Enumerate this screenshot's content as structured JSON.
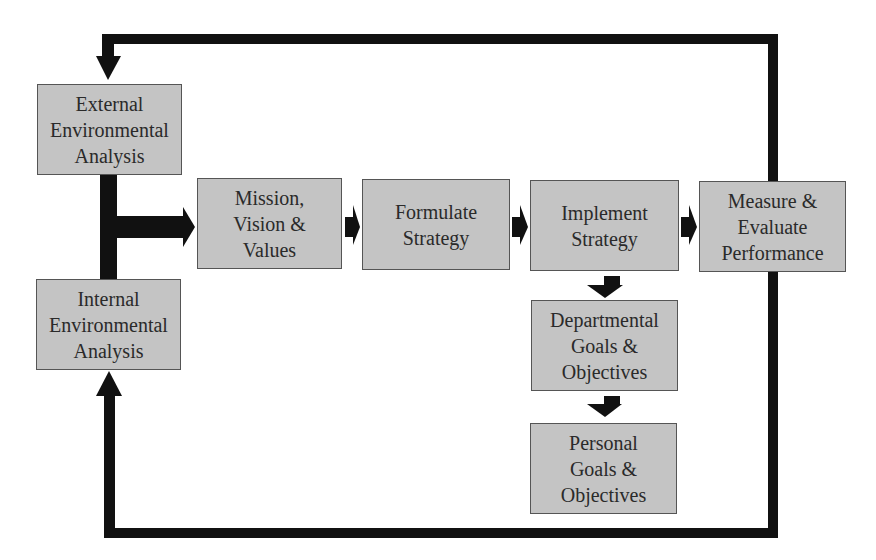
{
  "diagram": {
    "nodes": [
      {
        "id": "external",
        "label": "External\nEnvironmental\nAnalysis"
      },
      {
        "id": "internal",
        "label": "Internal\nEnvironmental\nAnalysis"
      },
      {
        "id": "mission",
        "label": "Mission,\nVision &\nValues"
      },
      {
        "id": "formulate",
        "label": "Formulate\nStrategy"
      },
      {
        "id": "implement",
        "label": "Implement\nStrategy"
      },
      {
        "id": "measure",
        "label": "Measure &\nEvaluate\nPerformance"
      },
      {
        "id": "departmental",
        "label": "Departmental\nGoals &\nObjectives"
      },
      {
        "id": "personal",
        "label": "Personal\nGoals &\nObjectives"
      }
    ],
    "edges": [
      {
        "from": "external",
        "to": "mission"
      },
      {
        "from": "internal",
        "to": "mission"
      },
      {
        "from": "mission",
        "to": "formulate"
      },
      {
        "from": "formulate",
        "to": "implement"
      },
      {
        "from": "implement",
        "to": "measure"
      },
      {
        "from": "implement",
        "to": "departmental"
      },
      {
        "from": "departmental",
        "to": "personal"
      },
      {
        "from": "measure",
        "to": "external",
        "note": "feedback loop over top"
      },
      {
        "from": "measure",
        "to": "internal",
        "note": "feedback loop along bottom"
      }
    ],
    "colors": {
      "box_fill": "#c4c4c4",
      "box_border": "#555555",
      "arrow": "#111111",
      "text": "#2a2a2a"
    }
  }
}
